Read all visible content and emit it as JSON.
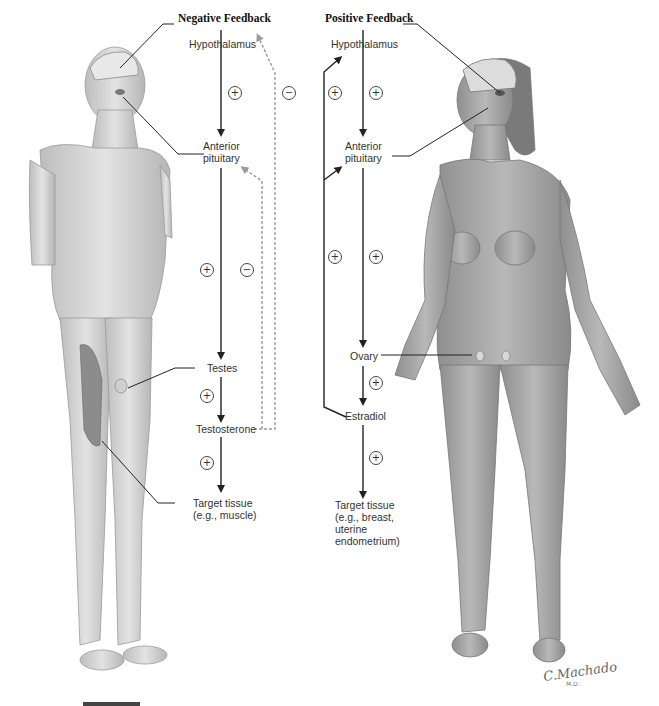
{
  "negative_feedback": {
    "title": "Negative Feedback",
    "nodes": {
      "hypothalamus": "Hypothalamus",
      "anterior_pituitary_line1": "Anterior",
      "anterior_pituitary_line2": "pituitary",
      "testes": "Testes",
      "testosterone": "Testosterone",
      "target_line1": "Target tissue",
      "target_line2": "(e.g., muscle)"
    },
    "signs": {
      "hypo_to_pit": "+",
      "pit_to_testes": "+",
      "testes_to_testosterone": "+",
      "testosterone_to_target": "+",
      "feedback_to_hypothalamus": "−",
      "feedback_to_pituitary": "−"
    }
  },
  "positive_feedback": {
    "title": "Positive Feedback",
    "nodes": {
      "hypothalamus": "Hypothalamus",
      "anterior_pituitary_line1": "Anterior",
      "anterior_pituitary_line2": "pituitary",
      "ovary": "Ovary",
      "estradiol": "Estradiol",
      "target_line1": "Target tissue",
      "target_line2": "(e.g., breast,",
      "target_line3": "uterine",
      "target_line4": "endometrium)"
    },
    "signs": {
      "feedback_upper": "+",
      "hypo_to_pit": "+",
      "feedback_lower": "+",
      "pit_to_ovary": "+",
      "ovary_to_estradiol": "+",
      "estradiol_to_target": "+"
    }
  },
  "figures": {
    "male": "Male figure with brain (hypothalamus, pituitary), testes and thigh muscle exposed",
    "female": "Female figure with brain (hypothalamus, pituitary) and ovaries shown"
  },
  "signature": {
    "name": "C.Machado",
    "suffix": "M.D."
  },
  "colors": {
    "axis_line": "#222222",
    "feedback_dashed": "#9a9a9a",
    "skin": "#c9c9c9"
  }
}
